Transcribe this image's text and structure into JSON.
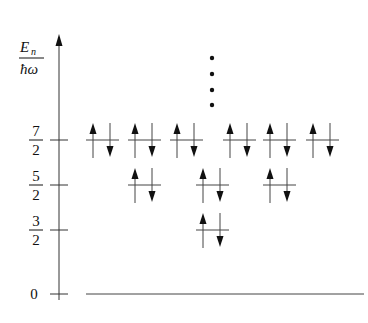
{
  "diagram": {
    "y_axis": {
      "label_numerator": "E",
      "label_numerator_sub": "n",
      "label_denominator": "ħω",
      "ticks": [
        {
          "num": "7",
          "den": "2",
          "value": 3.5,
          "y": 140
        },
        {
          "num": "5",
          "den": "2",
          "value": 2.5,
          "y": 185
        },
        {
          "num": "3",
          "den": "2",
          "value": 1.5,
          "y": 230
        },
        {
          "num": "0",
          "den": "",
          "value": 0,
          "y": 294
        }
      ]
    },
    "levels": [
      {
        "name": "3/2",
        "y": 230,
        "pairs": [
          196
        ]
      },
      {
        "name": "5/2",
        "y": 185,
        "pairs": [
          128,
          196,
          263
        ]
      },
      {
        "name": "7/2",
        "y": 140,
        "pairs": [
          86,
          128,
          170,
          223,
          263,
          306
        ]
      }
    ],
    "continuation": {
      "x": 212,
      "dots_y": [
        58,
        74,
        90,
        105
      ],
      "meaning": "more levels above"
    },
    "baseline": {
      "y": 294,
      "x1": 86,
      "x2": 364
    },
    "colors": {
      "ink": "#111111",
      "background": "#ffffff"
    }
  }
}
